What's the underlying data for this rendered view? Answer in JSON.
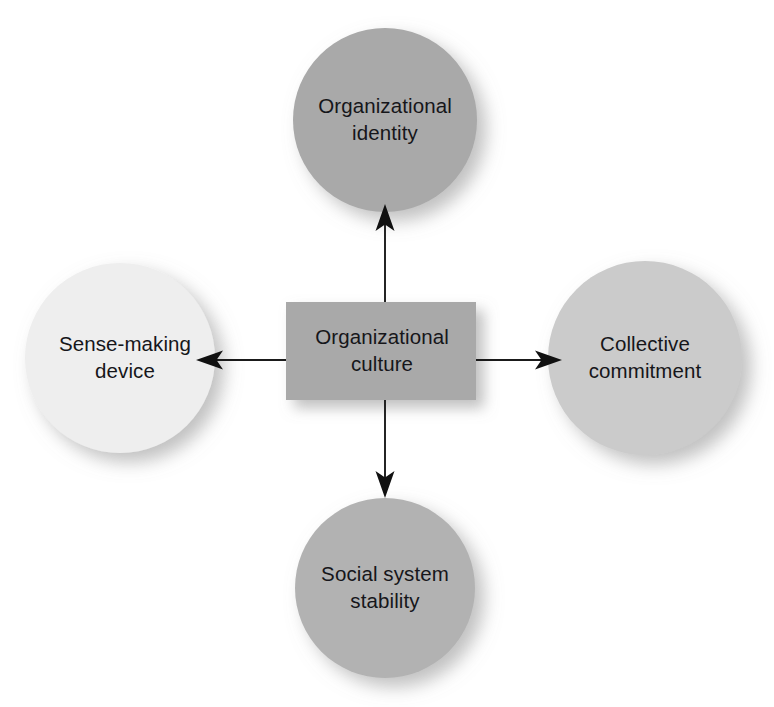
{
  "diagram": {
    "type": "hub-and-spoke",
    "title": "Organizational culture",
    "background_color": "#ffffff",
    "text_color": "#16161a",
    "arrow_color": "#1a1a1a",
    "center": {
      "id": "organizational-culture",
      "label": "Organizational\nculture",
      "shape": "rectangle",
      "fill": "#a9a9a9",
      "x": 286,
      "y": 302,
      "width": 190,
      "height": 98
    },
    "nodes": [
      {
        "id": "organizational-identity",
        "label": "Organizational\nidentity",
        "shape": "circle",
        "position": "top",
        "fill": "#a9a9a9",
        "cx": 385,
        "cy": 120,
        "r": 92
      },
      {
        "id": "collective-commitment",
        "label": "Collective\ncommitment",
        "shape": "circle",
        "position": "right",
        "fill": "#cbcbcb",
        "cx": 645,
        "cy": 358,
        "r": 97
      },
      {
        "id": "social-system-stability",
        "label": "Social system\nstability",
        "shape": "circle",
        "position": "bottom",
        "fill": "#b2b2b2",
        "cx": 385,
        "cy": 588,
        "r": 90
      },
      {
        "id": "sense-making-device",
        "label": "Sense-making\ndevice",
        "shape": "circle",
        "position": "left",
        "fill": "#eeeeee",
        "cx": 120,
        "cy": 358,
        "r": 95
      }
    ],
    "arrows": [
      {
        "id": "arrow-to-organizational-identity",
        "from": "organizational-culture",
        "to": "organizational-identity",
        "direction": "up"
      },
      {
        "id": "arrow-to-collective-commitment",
        "from": "organizational-culture",
        "to": "collective-commitment",
        "direction": "right"
      },
      {
        "id": "arrow-to-social-system-stability",
        "from": "organizational-culture",
        "to": "social-system-stability",
        "direction": "down"
      },
      {
        "id": "arrow-to-sense-making-device",
        "from": "organizational-culture",
        "to": "sense-making-device",
        "direction": "left"
      }
    ]
  }
}
